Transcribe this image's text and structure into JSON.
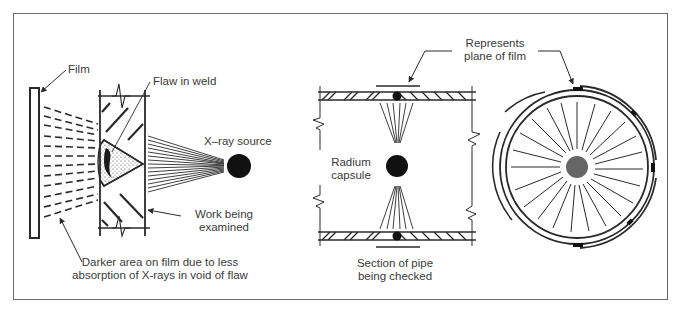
{
  "figure": {
    "panels": [
      {
        "id": "weld-radiography",
        "labels": {
          "film": "Film",
          "flaw": "Flaw in weld",
          "source": "X–ray source",
          "work_line1": "Work being",
          "work_line2": "examined",
          "darker_line1": "Darker area on film due to less",
          "darker_line2": "absorption of X-rays in void of flaw"
        }
      },
      {
        "id": "pipe-section",
        "labels": {
          "capsule_line1": "Radium",
          "capsule_line2": "capsule",
          "section_line1": "Section of pipe",
          "section_line2": "being checked"
        }
      },
      {
        "id": "pipe-circular",
        "labels": {
          "plane_line1": "Represents",
          "plane_line2": "plane of film"
        }
      }
    ],
    "colors": {
      "line": "#2a2a2a",
      "text": "#3a3a3a",
      "frame": "#6a6a6a",
      "capsule_gray": "#666666"
    }
  }
}
